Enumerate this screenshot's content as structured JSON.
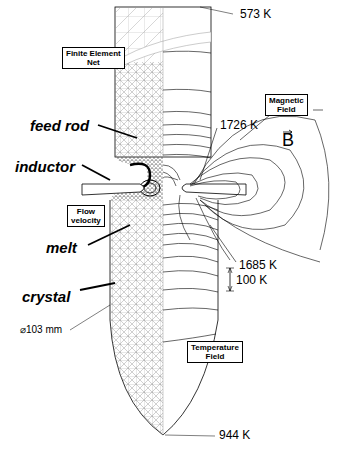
{
  "figure": {
    "temperatures": {
      "top": "573 K",
      "melt_top": "1726 K",
      "melt_bottom": "1685 K",
      "bottom": "944 K",
      "scale": "100 K"
    },
    "labels": {
      "feed_rod": "feed rod",
      "inductor": "inductor",
      "melt": "melt",
      "crystal": "crystal",
      "diameter": "⌀103 mm",
      "b_vector": "B"
    },
    "boxes": {
      "finite_element": "Finite Element\nNet",
      "magnetic_field": "Magnetic\nField",
      "flow_velocity": "Flow\nvelocity",
      "temperature_field": "Temperature\nField"
    },
    "colors": {
      "line": "#000000",
      "mesh": "#555555",
      "background": "#ffffff"
    }
  }
}
